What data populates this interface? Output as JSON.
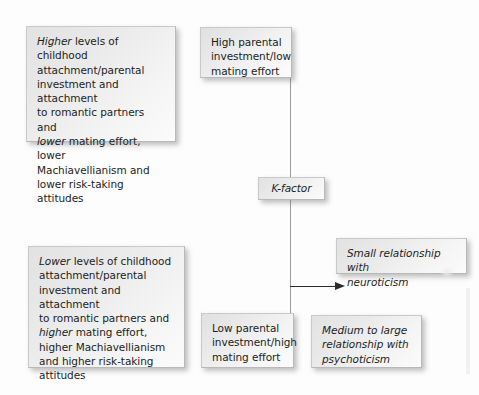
{
  "figure": {
    "type": "flow-diagram",
    "background_color": "#fdfdfd",
    "box_fill_color": "#ebebeb",
    "box_border_color": "#b9b9b9",
    "connector_color": "#9b9b9b",
    "arrow_color": "#2a2a2a"
  },
  "nodes": {
    "high_attachment": {
      "emphasis_lead": "Higher",
      "text": "Higher levels of childhood attachment/parental investment and attachment to romantic partners and lower mating effort, lower Machiavellianism and lower risk-taking attitudes",
      "line1_italic": "Higher",
      "line1_rest": " levels of childhood",
      "line2": "attachment/parental",
      "line3": "investment and attachment",
      "line4": "to romantic partners and",
      "line5_italic": "lower",
      "line5_rest": " mating effort, lower",
      "line6": "Machiavellianism and",
      "line7": "lower risk-taking",
      "line8": "attitudes"
    },
    "high_investment": {
      "text": "High parental investment/low mating effort",
      "line1": "High parental",
      "line2": "investment/low",
      "line3": "mating effort"
    },
    "k_factor": {
      "label_italic": "K",
      "label_rest": "-factor",
      "text": "K-factor"
    },
    "low_attachment": {
      "emphasis_lead": "Lower",
      "text": "Lower levels of childhood attachment/parental investment and attachment to romantic partners and higher mating effort, higher Machiavellianism and higher risk-taking attitudes",
      "line1_italic": "Lower",
      "line1_rest": " levels of childhood",
      "line2": "attachment/parental",
      "line3": "investment and attachment",
      "line4": "to romantic partners and",
      "line5_italic": "higher",
      "line5_rest": " mating effort,",
      "line6": "higher Machiavellianism",
      "line7": "and higher risk-taking",
      "line8": "attitudes"
    },
    "low_investment": {
      "text": "Low parental investment/high mating effort",
      "line1": "Low parental",
      "line2": "investment/high",
      "line3": "mating effort"
    },
    "neuroticism": {
      "text": "Small relationship with neuroticism",
      "line1": "Small relationship with",
      "line2": "neuroticism"
    },
    "psychoticism": {
      "text": "Medium to large relationship with psychoticism",
      "line1": "Medium to large",
      "line2": "relationship with",
      "line3": "psychoticism"
    }
  },
  "connectors": [
    {
      "name": "high-investment-to-k-factor",
      "from": "high_investment",
      "to": "k_factor",
      "style": "plain-line",
      "orientation": "vertical"
    },
    {
      "name": "k-factor-to-low-investment",
      "from": "k_factor",
      "to": "low_investment",
      "style": "plain-line",
      "orientation": "vertical"
    },
    {
      "name": "k-factor-to-psychoticism",
      "from": "k_factor",
      "to": "psychoticism",
      "style": "arrow",
      "orientation": "horizontal-right"
    }
  ]
}
